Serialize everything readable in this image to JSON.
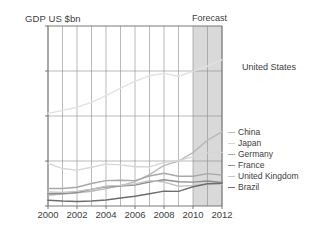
{
  "chart_data": {
    "type": "line",
    "title": "",
    "xlabel": "",
    "ylabel": "GDP US $bn",
    "ylim": [
      0,
      20000
    ],
    "xlim": [
      2000,
      2012
    ],
    "yticks": [
      0,
      5000,
      10000,
      15000,
      20000
    ],
    "ytick_labels": [
      "0",
      "5000",
      "10 000",
      "15 000",
      "20 000"
    ],
    "xticks": [
      2000,
      2002,
      2004,
      2006,
      2008,
      2010,
      2012
    ],
    "xtick_labels": [
      "2000",
      "2002",
      "2004",
      "2006",
      "2008",
      "2010",
      "2012"
    ],
    "x": [
      2000,
      2001,
      2002,
      2003,
      2004,
      2005,
      2006,
      2007,
      2008,
      2009,
      2010,
      2011,
      2012
    ],
    "grid": "both",
    "legend_position": "right",
    "annotations": [
      {
        "text": "Forecast",
        "x": 2010.8,
        "y": 20800
      }
    ],
    "shaded_regions": [
      {
        "label": "Forecast",
        "x0": 2010,
        "x1": 2012,
        "color": "#d2d2d2"
      }
    ],
    "series": [
      {
        "name": "United States",
        "color": "#e2e2e2",
        "values": [
          10285,
          10622,
          10978,
          11511,
          12275,
          13094,
          13856,
          14478,
          14719,
          14419,
          14958,
          15534,
          16245
        ],
        "label_position": "right"
      },
      {
        "name": "China",
        "color": "#b9b9b9",
        "values": [
          1198,
          1325,
          1454,
          1641,
          1932,
          2257,
          2713,
          3494,
          4522,
          4991,
          5930,
          7322,
          8227
        ]
      },
      {
        "name": "Japan",
        "color": "#d6d6d6",
        "values": [
          4731,
          4160,
          3981,
          4303,
          4656,
          4572,
          4357,
          4356,
          4849,
          5035,
          5495,
          5905,
          5960
        ]
      },
      {
        "name": "Germany",
        "color": "#a8a8a8",
        "values": [
          1950,
          1950,
          2079,
          2506,
          2819,
          2861,
          2819,
          3329,
          3640,
          3306,
          3310,
          3601,
          3430
        ]
      },
      {
        "name": "France",
        "color": "#8e8e8e",
        "values": [
          1368,
          1378,
          1495,
          1844,
          2119,
          2203,
          2325,
          2665,
          2923,
          2694,
          2650,
          2776,
          2613
        ]
      },
      {
        "name": "United Kingdom",
        "color": "#c4c4c4",
        "values": [
          1549,
          1510,
          1628,
          1873,
          2214,
          2295,
          2452,
          2816,
          2663,
          2199,
          2296,
          2445,
          2440
        ]
      },
      {
        "name": "Brazil",
        "color": "#6d6d6d",
        "values": [
          644,
          553,
          504,
          552,
          663,
          882,
          1089,
          1366,
          1653,
          1620,
          2143,
          2477,
          2530
        ]
      }
    ]
  },
  "chart": {
    "ylabel": "GDP US $bn",
    "forecast_label": "Forecast",
    "us_series_label": "United States"
  },
  "legend": {
    "items": [
      {
        "label": "China"
      },
      {
        "label": "Japan"
      },
      {
        "label": "Germany"
      },
      {
        "label": "France"
      },
      {
        "label": "United Kingdom"
      },
      {
        "label": "Brazil"
      }
    ]
  }
}
